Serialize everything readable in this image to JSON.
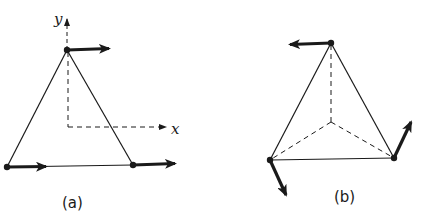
{
  "figure": {
    "panels": [
      {
        "id": "a",
        "caption": "(a)",
        "axes": {
          "x_label": "x",
          "y_label": "y"
        },
        "shape": "triangle",
        "vertices": [
          {
            "name": "top",
            "x": 67,
            "y": 50,
            "arrow": "right"
          },
          {
            "name": "bottom-left",
            "x": 7,
            "y": 167,
            "arrow": "right"
          },
          {
            "name": "bottom-right",
            "x": 133,
            "y": 165,
            "arrow": "right"
          }
        ]
      },
      {
        "id": "b",
        "caption": "(b)",
        "shape": "triangle-with-center-lines",
        "vertices": [
          {
            "name": "top",
            "x": 331,
            "y": 43,
            "arrow": "left"
          },
          {
            "name": "bottom-left",
            "x": 270,
            "y": 160,
            "arrow": "down-right"
          },
          {
            "name": "bottom-right",
            "x": 394,
            "y": 158,
            "arrow": "up-right"
          }
        ],
        "center": {
          "x": 331,
          "y": 122
        }
      }
    ],
    "colors": {
      "line": "#1a1a1a",
      "background": "#ffffff"
    }
  }
}
